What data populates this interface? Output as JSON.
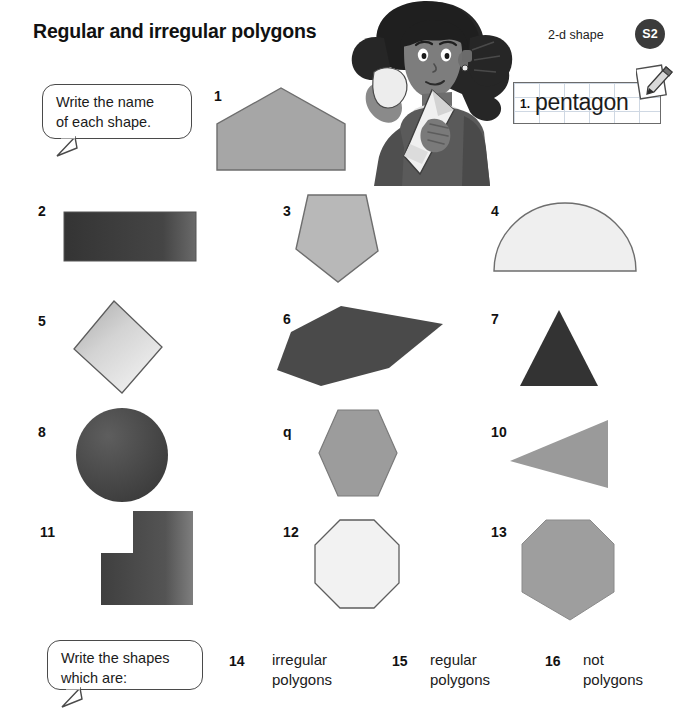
{
  "header": {
    "title": "Regular and irregular polygons",
    "strand_label": "2-d shape",
    "badge": "S2",
    "badge_color": "#3b3b3b"
  },
  "instructions": {
    "top_bubble": "Write the name\nof each shape.",
    "top_bubble_line1": "Write the name",
    "top_bubble_line2": "of each shape.",
    "bottom_bubble_line1": "Write the shapes",
    "bottom_bubble_line2": "which are:"
  },
  "worked_example": {
    "number": "1.",
    "answer": "pentagon",
    "icon": "pencil-notepad-icon"
  },
  "illustration": {
    "name": "girl-with-paper-shapes-illustration"
  },
  "shapes": [
    {
      "number": "1",
      "name": "house-pentagon",
      "shape_type": "pentagon",
      "fill": "#a6a6a6",
      "regular": false
    },
    {
      "number": "2",
      "name": "rectangle",
      "shape_type": "rectangle",
      "fill": "#3f3f3f",
      "regular": false
    },
    {
      "number": "3",
      "name": "pentagon",
      "shape_type": "pentagon",
      "fill": "#b8b8b8",
      "regular": false
    },
    {
      "number": "4",
      "name": "semicircle-dome",
      "shape_type": "semicircle",
      "fill": "#efefef",
      "regular": false
    },
    {
      "number": "5",
      "name": "tilted-square",
      "shape_type": "square",
      "fill": "#c9c9c9",
      "regular": true
    },
    {
      "number": "6",
      "name": "elongated-hexagon",
      "shape_type": "hexagon",
      "fill": "#4a4a4a",
      "regular": false
    },
    {
      "number": "7",
      "name": "triangle",
      "shape_type": "triangle",
      "fill": "#333333",
      "regular": false
    },
    {
      "number": "8",
      "name": "circle",
      "shape_type": "circle",
      "fill": "#4f4f4f",
      "regular": false
    },
    {
      "number": "q",
      "name": "hexagon",
      "shape_type": "hexagon",
      "fill": "#9c9c9c",
      "regular": true
    },
    {
      "number": "10",
      "name": "right-pointing-triangle",
      "shape_type": "triangle",
      "fill": "#9a9a9a",
      "regular": false
    },
    {
      "number": "11",
      "name": "l-shape",
      "shape_type": "l-shape",
      "fill": "#4d4d4d",
      "regular": false
    },
    {
      "number": "12",
      "name": "octagon",
      "shape_type": "octagon",
      "fill": "#f2f2f2",
      "regular": true
    },
    {
      "number": "13",
      "name": "irregular-heptagon",
      "shape_type": "heptagon",
      "fill": "#9e9e9e",
      "regular": false
    }
  ],
  "questions": [
    {
      "number": "14",
      "line1": "irregular",
      "line2": "polygons"
    },
    {
      "number": "15",
      "line1": "regular",
      "line2": "polygons"
    },
    {
      "number": "16",
      "line1": "not",
      "line2": "polygons"
    }
  ]
}
